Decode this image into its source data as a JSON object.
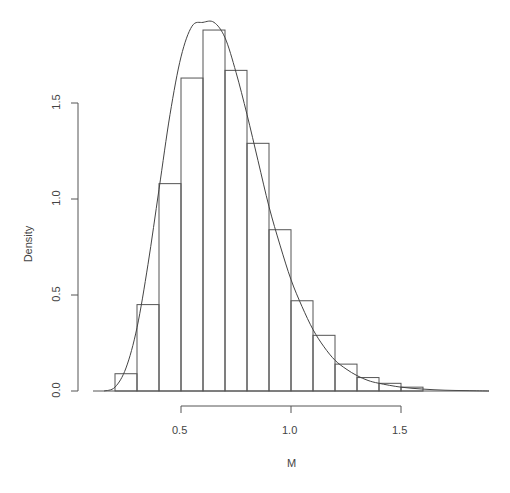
{
  "chart_data": {
    "type": "bar",
    "title": "",
    "xlabel": "M",
    "ylabel": "Density",
    "xlim": [
      0.1,
      1.9
    ],
    "ylim": [
      0,
      1.9
    ],
    "x_ticks": [
      "0.5",
      "1.0",
      "1.5"
    ],
    "y_ticks": [
      "0.0",
      "0.5",
      "1.0",
      "1.5"
    ],
    "grid": false,
    "legend": null,
    "bin_width": 0.1,
    "bins": [
      {
        "start": 0.2,
        "end": 0.3,
        "density": 0.09
      },
      {
        "start": 0.3,
        "end": 0.4,
        "density": 0.45
      },
      {
        "start": 0.4,
        "end": 0.5,
        "density": 1.08
      },
      {
        "start": 0.5,
        "end": 0.6,
        "density": 1.63
      },
      {
        "start": 0.6,
        "end": 0.7,
        "density": 1.88
      },
      {
        "start": 0.7,
        "end": 0.8,
        "density": 1.67
      },
      {
        "start": 0.8,
        "end": 0.9,
        "density": 1.29
      },
      {
        "start": 0.9,
        "end": 1.0,
        "density": 0.84
      },
      {
        "start": 1.0,
        "end": 1.1,
        "density": 0.47
      },
      {
        "start": 1.1,
        "end": 1.2,
        "density": 0.29
      },
      {
        "start": 1.2,
        "end": 1.3,
        "density": 0.14
      },
      {
        "start": 1.3,
        "end": 1.4,
        "density": 0.07
      },
      {
        "start": 1.4,
        "end": 1.5,
        "density": 0.04
      },
      {
        "start": 1.5,
        "end": 1.6,
        "density": 0.02
      }
    ],
    "density_curve": {
      "description": "Smooth fitted density curve overlaid on histogram, peaking near M=0.66 at ~1.92",
      "x": [
        0.15,
        0.2,
        0.25,
        0.3,
        0.35,
        0.4,
        0.45,
        0.5,
        0.55,
        0.6,
        0.65,
        0.7,
        0.75,
        0.8,
        0.85,
        0.9,
        0.95,
        1.0,
        1.05,
        1.1,
        1.15,
        1.2,
        1.25,
        1.3,
        1.35,
        1.4,
        1.5,
        1.6,
        1.7,
        1.8,
        1.9
      ],
      "y": [
        0.0,
        0.02,
        0.12,
        0.33,
        0.66,
        1.05,
        1.44,
        1.74,
        1.9,
        1.92,
        1.92,
        1.84,
        1.66,
        1.44,
        1.2,
        0.96,
        0.76,
        0.58,
        0.44,
        0.32,
        0.23,
        0.16,
        0.115,
        0.08,
        0.055,
        0.04,
        0.02,
        0.01,
        0.004,
        0.002,
        0.0
      ]
    }
  }
}
